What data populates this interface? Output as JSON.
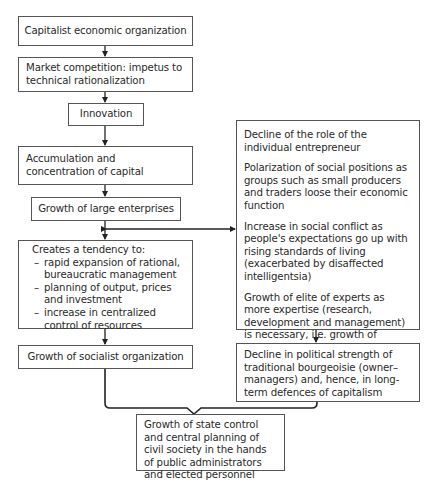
{
  "left_column": {
    "boxes": [
      {
        "id": "capitalist-economic-organization",
        "text": "Capitalist economic organization"
      },
      {
        "id": "market-competition",
        "text": "Market competition: impetus to technical rationalization"
      },
      {
        "id": "innovation",
        "text": "Innovation"
      },
      {
        "id": "accumulation-concentration",
        "text": "Accumulation and concentration of capital"
      },
      {
        "id": "growth-large-enterprises",
        "text": "Growth of large enterprises"
      },
      {
        "id": "creates-tendency",
        "heading": "Creates a tendency to:",
        "items": [
          "rapid expansion of rational, bureaucratic management",
          "planning of output, prices and investment",
          "increase in centralized control of resources"
        ]
      },
      {
        "id": "growth-socialist-organization",
        "text": "Growth of socialist organization"
      }
    ]
  },
  "right_column": {
    "consequences_box": {
      "paragraphs": [
        "Decline of the role of the individual entrepreneur",
        "Polarization of social positions as groups such as small producers and traders loose their economic function",
        "Increase in social conflict as people's expectations go up with rising standards of living (exacerbated by disaffected intelligentsia)",
        "Growth of elite of experts as more expertise (research, development and management) is necessary, i.e. growth of executive managerial stratum"
      ]
    },
    "decline_box": {
      "text": "Decline in political strength of traditional bourgeoisie (owner–managers) and, hence, in long-term defences of capitalism"
    }
  },
  "outcome_box": {
    "text": "Growth of state control and central planning of civil society in the hands of public administrators and elected personnel"
  },
  "edges": [
    {
      "from": "capitalist-economic-organization",
      "to": "market-competition",
      "type": "arrow"
    },
    {
      "from": "market-competition",
      "to": "innovation",
      "type": "arrow"
    },
    {
      "from": "innovation",
      "to": "accumulation-concentration",
      "type": "arrow"
    },
    {
      "from": "accumulation-concentration",
      "to": "growth-large-enterprises",
      "type": "arrow"
    },
    {
      "from": "growth-large-enterprises",
      "to": "creates-tendency",
      "type": "arrow"
    },
    {
      "from": "growth-large-enterprises",
      "to": "consequences_box",
      "type": "bidirectional-arrow"
    },
    {
      "from": "creates-tendency",
      "to": "growth-socialist-organization",
      "type": "arrow"
    },
    {
      "from": "consequences_box",
      "to": "decline_box",
      "type": "arrow"
    },
    {
      "from": [
        "growth-socialist-organization",
        "decline_box"
      ],
      "to": "outcome_box",
      "type": "brace-merge"
    }
  ]
}
